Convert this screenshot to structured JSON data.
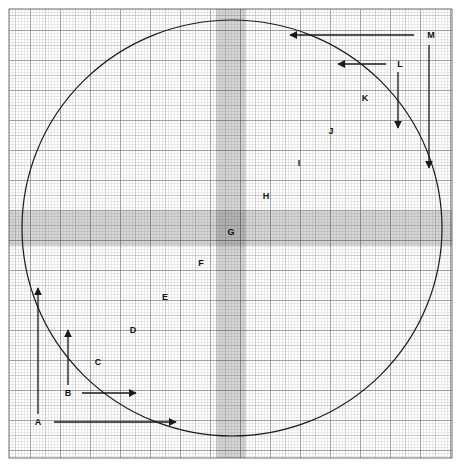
{
  "figure": {
    "kind": "graph-paper-circle-diagram",
    "background_color": "#ffffff",
    "paper": {
      "x": 9,
      "y": 9,
      "width": 443,
      "height": 449,
      "fine_grid_step_px": 3,
      "medium_grid_step_px": 15,
      "heavy_grid_step_px": 30,
      "fine_grid_color": "#b9b9b9",
      "medium_grid_color": "#9a9a9a",
      "heavy_grid_color": "#5d5d5d",
      "border_color": "#6e6e6e"
    },
    "circle": {
      "center_x": 232,
      "center_y": 228,
      "radius_x": 210,
      "radius_y": 208,
      "stroke_color": "#1a1a1a",
      "stroke_width": 1.2,
      "fill": "none"
    },
    "bands": [
      {
        "name": "vertical-shaded-band",
        "orientation": "vertical",
        "x": 216,
        "y": 9,
        "width": 30,
        "height": 449,
        "shade_color": "#000000",
        "opacity": 0.16
      },
      {
        "name": "horizontal-shaded-band",
        "orientation": "horizontal",
        "x": 9,
        "y": 211,
        "width": 443,
        "height": 35,
        "shade_color": "#000000",
        "opacity": 0.16
      }
    ],
    "region_labels": [
      {
        "id": "C",
        "text": "C",
        "x": 98,
        "y": 362
      },
      {
        "id": "D",
        "text": "D",
        "x": 133,
        "y": 330
      },
      {
        "id": "E",
        "text": "E",
        "x": 165,
        "y": 297
      },
      {
        "id": "F",
        "text": "F",
        "x": 201,
        "y": 263
      },
      {
        "id": "G",
        "text": "G",
        "x": 231,
        "y": 232
      },
      {
        "id": "H",
        "text": "H",
        "x": 266,
        "y": 196
      },
      {
        "id": "I",
        "text": "I",
        "x": 299,
        "y": 163
      },
      {
        "id": "J",
        "text": "J",
        "x": 331,
        "y": 131
      },
      {
        "id": "K",
        "text": "K",
        "x": 365,
        "y": 98
      }
    ],
    "dimension_callouts": [
      {
        "id": "A",
        "text": "A",
        "label_x": 38,
        "label_y": 422,
        "horizontal_arrow": {
          "x1": 54,
          "y1": 422,
          "x2": 176,
          "y2": 422,
          "direction": "right"
        },
        "vertical_arrow": {
          "x1": 38,
          "y1": 414,
          "x2": 38,
          "y2": 288,
          "direction": "up"
        }
      },
      {
        "id": "B",
        "text": "B",
        "label_x": 68,
        "label_y": 393,
        "horizontal_arrow": {
          "x1": 82,
          "y1": 393,
          "x2": 136,
          "y2": 393,
          "direction": "right"
        },
        "vertical_arrow": {
          "x1": 68,
          "y1": 385,
          "x2": 68,
          "y2": 330,
          "direction": "up"
        }
      },
      {
        "id": "L",
        "text": "L",
        "label_x": 400,
        "label_y": 64,
        "horizontal_arrow": {
          "x1": 386,
          "y1": 64,
          "x2": 338,
          "y2": 64,
          "direction": "left"
        },
        "vertical_arrow": {
          "x1": 398,
          "y1": 72,
          "x2": 398,
          "y2": 128,
          "direction": "down"
        }
      },
      {
        "id": "M",
        "text": "M",
        "label_x": 431,
        "label_y": 35,
        "horizontal_arrow": {
          "x1": 414,
          "y1": 35,
          "x2": 290,
          "y2": 35,
          "direction": "left"
        },
        "vertical_arrow": {
          "x1": 429,
          "y1": 45,
          "x2": 429,
          "y2": 168,
          "direction": "down"
        }
      }
    ],
    "arrow_color": "#1a1a1a",
    "arrow_stroke_width": 1.3
  }
}
